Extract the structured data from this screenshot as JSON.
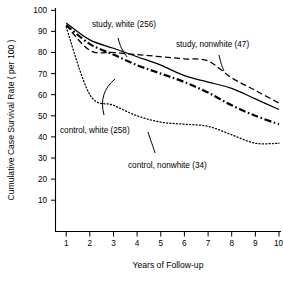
{
  "chart_data": {
    "type": "line",
    "title": "",
    "xlabel": "Years of Follow-up",
    "ylabel": "Cumulative Case Survival Rate ( per 100 )",
    "xlim": [
      0,
      10
    ],
    "ylim": [
      0,
      100
    ],
    "grid": false,
    "legend_position": "inline-annotations",
    "xticks": [
      "1",
      "2",
      "3",
      "4",
      "5",
      "6",
      "7",
      "8",
      "9",
      "10"
    ],
    "xtick_values": [
      1,
      2,
      3,
      4,
      5,
      6,
      7,
      8,
      9,
      10
    ],
    "yticks": [
      "10",
      "20",
      "30",
      "40",
      "50",
      "60",
      "70",
      "80",
      "90",
      "100"
    ],
    "ytick_values": [
      10,
      20,
      30,
      40,
      50,
      60,
      70,
      80,
      90,
      100
    ],
    "x": [
      1,
      2,
      3,
      4,
      5,
      6,
      7,
      8,
      9,
      10
    ],
    "series": [
      {
        "name": "study, white (256)",
        "label": "study, white (256)",
        "group": "study",
        "race": "white",
        "n": 256,
        "style": "solid",
        "values": [
          94,
          86,
          82,
          78,
          74,
          69,
          66,
          63,
          58,
          53
        ]
      },
      {
        "name": "study, nonwhite (47)",
        "label": "study, nonwhite (47)",
        "group": "study",
        "race": "nonwhite",
        "n": 47,
        "style": "dashed",
        "values": [
          93,
          81,
          80,
          79,
          78,
          77,
          76,
          68,
          62,
          56
        ]
      },
      {
        "name": "control, white (258)",
        "label": "control, white (258)",
        "group": "control",
        "race": "white",
        "n": 258,
        "style": "dash-dot",
        "values": [
          93,
          84,
          79,
          74,
          70,
          66,
          61,
          55,
          50,
          46
        ]
      },
      {
        "name": "control, nonwhite (34)",
        "label": "control, nonwhite (34)",
        "group": "control",
        "race": "nonwhite",
        "n": 34,
        "style": "dotted",
        "values": [
          92,
          60,
          55,
          50,
          47,
          46,
          45,
          41,
          37,
          37
        ]
      }
    ],
    "annotations": [
      {
        "text": "study, white (256)",
        "target_series": "study, white (256)"
      },
      {
        "text": "study, nonwhite (47)",
        "target_series": "study, nonwhite (47)"
      },
      {
        "text": "control, white (258)",
        "target_series": "control, white (258)"
      },
      {
        "text": "control, nonwhite (34)",
        "target_series": "control, nonwhite (34)"
      }
    ]
  }
}
